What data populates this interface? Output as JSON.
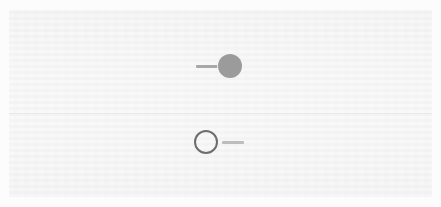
{
  "canvas": {
    "width": 441,
    "height": 207,
    "page_background": "#fcfcfc",
    "panel_background": "#f4f4f4",
    "panel_seam_color": "#e6e6e6"
  },
  "panel": {
    "name": "marker-legend-panel",
    "x": 9,
    "y": 10,
    "width": 423,
    "height": 187,
    "label": "",
    "title": "",
    "caption": ""
  },
  "markers": [
    {
      "id": "filled-disc-marker",
      "style": "filled",
      "shape": "circle",
      "fill_color": "#9b9b9b",
      "stroke_color": "#9b9b9b",
      "diameter_px": 24,
      "center_x": 238,
      "center_y": 67,
      "label": "",
      "leader": {
        "side": "left",
        "color": "#a8a8a8",
        "length_px": 24,
        "thickness_px": 3,
        "from_x": 196,
        "to_x": 220,
        "y": 66
      }
    },
    {
      "id": "hollow-ring-marker",
      "style": "hollow",
      "shape": "circle",
      "fill_color": "transparent",
      "stroke_color": "#6e6e6e",
      "stroke_width_px": 2.5,
      "diameter_px": 25,
      "center_x": 207,
      "center_y": 143,
      "label": "",
      "leader": {
        "side": "right",
        "color": "#bdbdbd",
        "length_px": 22,
        "thickness_px": 2.5,
        "from_x": 222,
        "to_x": 244,
        "y": 142
      }
    }
  ]
}
